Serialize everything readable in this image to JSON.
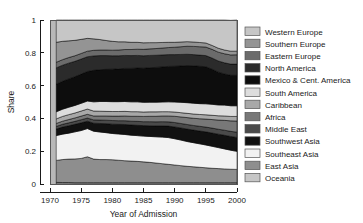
{
  "chart_data": {
    "type": "area",
    "title": "",
    "xlabel": "Year of Admission",
    "ylabel": "Share",
    "xlim": [
      1970,
      2000
    ],
    "ylim": [
      0,
      1
    ],
    "grid": false,
    "legend_position": "right",
    "stacked": true,
    "stack_order_bottom_to_top": [
      "Oceania",
      "East Asia",
      "Southeast Asia",
      "Southwest Asia",
      "Middle East",
      "Africa",
      "Caribbean",
      "South America",
      "Mexico & Cent. America",
      "North America",
      "Eastern Europe",
      "Southern Europe",
      "Western Europe"
    ],
    "xticks": [
      1970,
      1975,
      1980,
      1985,
      1990,
      1995,
      2000
    ],
    "xtick_labels": [
      "1970",
      "1975",
      "1980",
      "1985",
      "1990",
      "1995",
      "2000"
    ],
    "yticks": [
      0,
      0.2,
      0.4,
      0.6,
      0.8,
      1
    ],
    "ytick_labels": [
      "0",
      "0.2",
      "0.4",
      "0.6",
      "0.8",
      "1"
    ],
    "x": [
      1971,
      1972,
      1973,
      1974,
      1975,
      1976,
      1977,
      1978,
      1979,
      1980,
      1981,
      1982,
      1983,
      1984,
      1985,
      1986,
      1987,
      1988,
      1989,
      1990,
      1991,
      1992,
      1993,
      1994,
      1995,
      1996,
      1997,
      1998,
      1999,
      2000
    ],
    "series": [
      {
        "name": "Oceania",
        "color": "#9c9c9c",
        "values": [
          0.01,
          0.009,
          0.009,
          0.008,
          0.008,
          0.008,
          0.008,
          0.008,
          0.008,
          0.008,
          0.008,
          0.008,
          0.008,
          0.008,
          0.008,
          0.008,
          0.008,
          0.008,
          0.008,
          0.008,
          0.008,
          0.008,
          0.008,
          0.008,
          0.008,
          0.008,
          0.008,
          0.008,
          0.008,
          0.008
        ]
      },
      {
        "name": "East Asia",
        "color": "#8e8e8e",
        "values": [
          0.134,
          0.14,
          0.143,
          0.145,
          0.148,
          0.158,
          0.144,
          0.141,
          0.141,
          0.14,
          0.137,
          0.134,
          0.132,
          0.13,
          0.127,
          0.124,
          0.12,
          0.116,
          0.112,
          0.108,
          0.104,
          0.1,
          0.097,
          0.094,
          0.091,
          0.088,
          0.086,
          0.084,
          0.082,
          0.081
        ]
      },
      {
        "name": "Southeast Asia",
        "color": "#f2f2f2",
        "values": [
          0.151,
          0.155,
          0.158,
          0.165,
          0.17,
          0.172,
          0.17,
          0.168,
          0.164,
          0.16,
          0.16,
          0.16,
          0.158,
          0.157,
          0.157,
          0.158,
          0.16,
          0.162,
          0.163,
          0.16,
          0.156,
          0.151,
          0.147,
          0.143,
          0.139,
          0.134,
          0.128,
          0.122,
          0.116,
          0.11
        ]
      },
      {
        "name": "Southwest Asia",
        "color": "#111111",
        "values": [
          0.04,
          0.043,
          0.045,
          0.046,
          0.047,
          0.045,
          0.049,
          0.052,
          0.055,
          0.057,
          0.059,
          0.061,
          0.062,
          0.063,
          0.064,
          0.065,
          0.066,
          0.068,
          0.07,
          0.072,
          0.074,
          0.076,
          0.077,
          0.078,
          0.08,
          0.081,
          0.082,
          0.083,
          0.084,
          0.085
        ]
      },
      {
        "name": "Middle East",
        "color": "#4a4a4a",
        "values": [
          0.016,
          0.017,
          0.018,
          0.018,
          0.019,
          0.019,
          0.02,
          0.021,
          0.021,
          0.022,
          0.022,
          0.023,
          0.023,
          0.024,
          0.024,
          0.025,
          0.025,
          0.026,
          0.026,
          0.027,
          0.027,
          0.028,
          0.028,
          0.029,
          0.029,
          0.03,
          0.03,
          0.031,
          0.031,
          0.032
        ]
      },
      {
        "name": "Africa",
        "color": "#787878",
        "values": [
          0.018,
          0.019,
          0.02,
          0.021,
          0.022,
          0.023,
          0.024,
          0.025,
          0.026,
          0.027,
          0.028,
          0.029,
          0.03,
          0.031,
          0.032,
          0.033,
          0.034,
          0.035,
          0.036,
          0.038,
          0.04,
          0.042,
          0.044,
          0.046,
          0.049,
          0.052,
          0.056,
          0.06,
          0.064,
          0.068
        ]
      },
      {
        "name": "Caribbean",
        "color": "#a8a8a8",
        "values": [
          0.028,
          0.029,
          0.03,
          0.03,
          0.031,
          0.032,
          0.03,
          0.029,
          0.028,
          0.028,
          0.028,
          0.028,
          0.028,
          0.028,
          0.027,
          0.027,
          0.027,
          0.026,
          0.026,
          0.026,
          0.026,
          0.026,
          0.026,
          0.026,
          0.026,
          0.026,
          0.026,
          0.027,
          0.027,
          0.028
        ]
      },
      {
        "name": "South America",
        "color": "#dddddd",
        "values": [
          0.043,
          0.044,
          0.045,
          0.046,
          0.047,
          0.049,
          0.056,
          0.059,
          0.06,
          0.06,
          0.06,
          0.06,
          0.06,
          0.06,
          0.059,
          0.059,
          0.059,
          0.059,
          0.06,
          0.061,
          0.063,
          0.065,
          0.066,
          0.066,
          0.067,
          0.067,
          0.066,
          0.066,
          0.065,
          0.065
        ]
      },
      {
        "name": "Mexico & Cent. America",
        "color": "#0d0d0d",
        "values": [
          0.168,
          0.17,
          0.173,
          0.175,
          0.178,
          0.18,
          0.192,
          0.194,
          0.196,
          0.198,
          0.2,
          0.202,
          0.204,
          0.206,
          0.208,
          0.21,
          0.212,
          0.214,
          0.216,
          0.218,
          0.222,
          0.226,
          0.228,
          0.228,
          0.226,
          0.214,
          0.2,
          0.19,
          0.186,
          0.186
        ]
      },
      {
        "name": "North America",
        "color": "#2b2b2b",
        "values": [
          0.1,
          0.098,
          0.096,
          0.094,
          0.092,
          0.09,
          0.088,
          0.086,
          0.084,
          0.082,
          0.08,
          0.079,
          0.078,
          0.077,
          0.076,
          0.075,
          0.074,
          0.073,
          0.072,
          0.071,
          0.07,
          0.069,
          0.068,
          0.068,
          0.068,
          0.068,
          0.068,
          0.068,
          0.068,
          0.068
        ]
      },
      {
        "name": "Eastern Europe",
        "color": "#6b6b6b",
        "values": [
          0.034,
          0.034,
          0.034,
          0.034,
          0.034,
          0.034,
          0.034,
          0.034,
          0.034,
          0.034,
          0.035,
          0.036,
          0.037,
          0.038,
          0.039,
          0.04,
          0.041,
          0.042,
          0.043,
          0.045,
          0.047,
          0.049,
          0.05,
          0.051,
          0.052,
          0.053,
          0.054,
          0.055,
          0.056,
          0.057
        ]
      },
      {
        "name": "Southern Europe",
        "color": "#949494",
        "values": [
          0.122,
          0.112,
          0.102,
          0.094,
          0.086,
          0.078,
          0.07,
          0.064,
          0.058,
          0.054,
          0.05,
          0.047,
          0.044,
          0.042,
          0.04,
          0.038,
          0.036,
          0.034,
          0.032,
          0.03,
          0.029,
          0.028,
          0.027,
          0.026,
          0.025,
          0.024,
          0.024,
          0.023,
          0.023,
          0.022
        ]
      },
      {
        "name": "Western Europe",
        "color": "#c6c6c6",
        "values": [
          0.136,
          0.13,
          0.127,
          0.124,
          0.118,
          0.112,
          0.115,
          0.119,
          0.125,
          0.13,
          0.133,
          0.133,
          0.136,
          0.136,
          0.139,
          0.138,
          0.138,
          0.137,
          0.136,
          0.136,
          0.134,
          0.132,
          0.134,
          0.137,
          0.14,
          0.155,
          0.172,
          0.183,
          0.188,
          0.19
        ]
      }
    ]
  },
  "legend": {
    "items": [
      {
        "label": "Western Europe",
        "color": "#c6c6c6"
      },
      {
        "label": "Southern Europe",
        "color": "#949494"
      },
      {
        "label": "Eastern Europe",
        "color": "#6b6b6b"
      },
      {
        "label": "North America",
        "color": "#2b2b2b"
      },
      {
        "label": "Mexico & Cent. America",
        "color": "#0d0d0d"
      },
      {
        "label": "South America",
        "color": "#dddddd"
      },
      {
        "label": "Caribbean",
        "color": "#a8a8a8"
      },
      {
        "label": "Africa",
        "color": "#787878"
      },
      {
        "label": "Middle East",
        "color": "#4a4a4a"
      },
      {
        "label": "Southwest Asia",
        "color": "#111111"
      },
      {
        "label": "Southeast Asia",
        "color": "#f2f2f2"
      },
      {
        "label": "East Asia",
        "color": "#8e8e8e"
      },
      {
        "label": "Oceania",
        "color": "#c6c6c6"
      }
    ]
  }
}
